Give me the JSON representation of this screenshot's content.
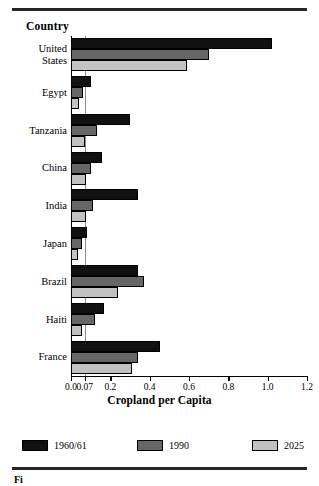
{
  "figure": {
    "caption": "Fi"
  },
  "chart_data": {
    "type": "bar",
    "orientation": "horizontal",
    "title": "",
    "xlabel": "Cropland per Capita",
    "ylabel": "Country",
    "xlim": [
      0.0,
      1.2
    ],
    "xticks": [
      "0.0",
      "0.07",
      "0.2",
      "0.4",
      "0.6",
      "0.8",
      "1.0",
      "1.2"
    ],
    "xtick_values": [
      0.0,
      0.07,
      0.2,
      0.4,
      0.6,
      0.8,
      1.0,
      1.2
    ],
    "reference_line": 0.07,
    "grid": false,
    "legend_position": "bottom",
    "categories": [
      "United States",
      "Egypt",
      "Tanzania",
      "China",
      "India",
      "Japan",
      "Brazil",
      "Haiti",
      "France"
    ],
    "series": [
      {
        "name": "1960/61",
        "color": "#111111",
        "values": [
          1.02,
          0.1,
          0.3,
          0.16,
          0.34,
          0.08,
          0.34,
          0.17,
          0.45
        ]
      },
      {
        "name": "1990",
        "color": "#666666",
        "values": [
          0.7,
          0.06,
          0.13,
          0.1,
          0.11,
          0.055,
          0.37,
          0.12,
          0.34
        ]
      },
      {
        "name": "2025",
        "color": "#c2c2c2",
        "values": [
          0.59,
          0.04,
          0.07,
          0.075,
          0.075,
          0.035,
          0.24,
          0.055,
          0.31
        ]
      }
    ]
  }
}
